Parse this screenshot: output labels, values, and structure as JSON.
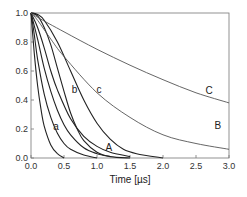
{
  "chart_data": {
    "type": "line",
    "title": "",
    "xlabel": "Time [µs]",
    "ylabel": "",
    "xlim": [
      0.0,
      3.0
    ],
    "ylim": [
      0.0,
      1.0
    ],
    "xticks": [
      "0.0",
      "0.5",
      "1.0",
      "1.5",
      "2.0",
      "2.5",
      "3.0"
    ],
    "yticks": [
      "0.0",
      "0.2",
      "0.4",
      "0.6",
      "0.8",
      "1.0"
    ],
    "grid": false,
    "legend": "inline labels",
    "series": [
      {
        "name": "unlabeled-1",
        "x": [
          0,
          0.05,
          0.1,
          0.15,
          0.2,
          0.3,
          0.4,
          0.5
        ],
        "values": [
          1.0,
          0.72,
          0.5,
          0.34,
          0.22,
          0.09,
          0.03,
          0.0
        ]
      },
      {
        "name": "unlabeled-2",
        "x": [
          0,
          0.05,
          0.1,
          0.2,
          0.3,
          0.4,
          0.5,
          0.6,
          0.8,
          1.0
        ],
        "values": [
          1.0,
          0.85,
          0.68,
          0.44,
          0.28,
          0.17,
          0.1,
          0.06,
          0.02,
          0.0
        ]
      },
      {
        "name": "a",
        "x": [
          0,
          0.1,
          0.2,
          0.3,
          0.4,
          0.5,
          0.6,
          0.8,
          1.0,
          1.2
        ],
        "values": [
          1.0,
          0.82,
          0.62,
          0.46,
          0.33,
          0.23,
          0.16,
          0.07,
          0.03,
          0.01
        ]
      },
      {
        "name": "A",
        "x": [
          0,
          0.1,
          0.2,
          0.3,
          0.4,
          0.6,
          0.8,
          1.0,
          1.2,
          1.5
        ],
        "values": [
          1.0,
          0.9,
          0.76,
          0.6,
          0.47,
          0.27,
          0.15,
          0.08,
          0.04,
          0.01
        ]
      },
      {
        "name": "b",
        "x": [
          0,
          0.1,
          0.2,
          0.3,
          0.4,
          0.5,
          0.6,
          0.7,
          0.8,
          1.0,
          1.2,
          1.5
        ],
        "values": [
          1.0,
          0.98,
          0.9,
          0.78,
          0.62,
          0.46,
          0.31,
          0.2,
          0.12,
          0.04,
          0.01,
          0.0
        ]
      },
      {
        "name": "c",
        "x": [
          0,
          0.1,
          0.2,
          0.4,
          0.6,
          0.8,
          1.0,
          1.2,
          1.4,
          1.6,
          2.0
        ],
        "values": [
          1.0,
          0.99,
          0.95,
          0.8,
          0.6,
          0.4,
          0.24,
          0.13,
          0.06,
          0.03,
          0.0
        ]
      },
      {
        "name": "B",
        "x": [
          0,
          0.1,
          0.3,
          0.5,
          1.0,
          1.5,
          2.0,
          2.5,
          3.0
        ],
        "values": [
          1.0,
          0.95,
          0.82,
          0.7,
          0.45,
          0.28,
          0.16,
          0.1,
          0.06
        ]
      },
      {
        "name": "C",
        "x": [
          0,
          0.1,
          0.5,
          1.0,
          1.5,
          2.0,
          2.5,
          3.0
        ],
        "values": [
          1.0,
          0.97,
          0.87,
          0.75,
          0.64,
          0.54,
          0.45,
          0.38
        ]
      }
    ],
    "annotations": [
      {
        "text": "a",
        "x": 0.38,
        "y": 0.19
      },
      {
        "text": "b",
        "x": 0.66,
        "y": 0.45
      },
      {
        "text": "c",
        "x": 1.03,
        "y": 0.45
      },
      {
        "text": "A",
        "x": 1.18,
        "y": 0.05
      },
      {
        "text": "B",
        "x": 2.83,
        "y": 0.2
      },
      {
        "text": "C",
        "x": 2.7,
        "y": 0.44
      }
    ]
  }
}
